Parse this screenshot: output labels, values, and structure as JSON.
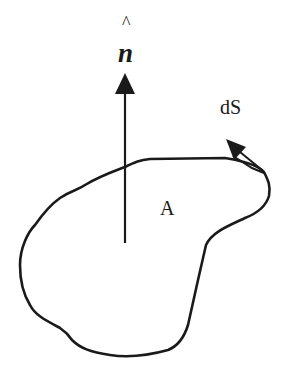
{
  "diagram": {
    "type": "surface-normal-illustration",
    "labels": {
      "normal_hat": "^",
      "normal_symbol": "n",
      "surface_element": "dS",
      "area": "A"
    },
    "elements": [
      {
        "name": "closed-region-outline",
        "description": "irregular closed curve (kidney-shaped) bounding area A"
      },
      {
        "name": "normal-vector-arrow",
        "description": "vertical arrow pointing up from inside region, labeled n-hat"
      },
      {
        "name": "surface-element-arrow",
        "description": "small arrow on top-right boundary, labeled dS"
      }
    ],
    "colors": {
      "stroke": "#1a1a1a",
      "background": "#ffffff"
    }
  }
}
